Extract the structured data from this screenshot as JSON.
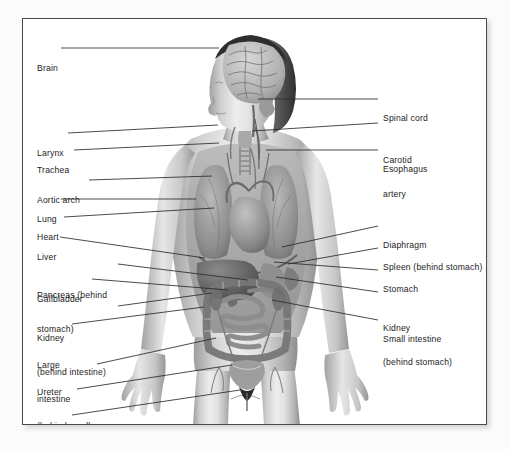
{
  "panel": {
    "border_color": "#4a4a4a",
    "background": "#ffffff"
  },
  "figure": {
    "style": "grayscale medical illustration",
    "ink": "#4b4b4b"
  },
  "labels_left": [
    {
      "text": "Brain",
      "lines": [
        "Brain"
      ]
    },
    {
      "text": "Larynx",
      "lines": [
        "Larynx"
      ]
    },
    {
      "text": "Trachea",
      "lines": [
        "Trachea"
      ]
    },
    {
      "text": "Aortic arch",
      "lines": [
        "Aortic arch"
      ]
    },
    {
      "text": "Lung",
      "lines": [
        "Lung"
      ]
    },
    {
      "text": "Heart",
      "lines": [
        "Heart"
      ]
    },
    {
      "text": "Liver",
      "lines": [
        "Liver"
      ]
    },
    {
      "text": "Pancreas (behind stomach)",
      "lines": [
        "Pancreas (behind",
        "stomach)"
      ]
    },
    {
      "text": "Gallbladder",
      "lines": [
        "Gallbladder"
      ]
    },
    {
      "text": "Kidney (behind intestine)",
      "lines": [
        "Kidney",
        "(behind intestine)"
      ]
    },
    {
      "text": "Large intestine",
      "lines": [
        "Large",
        "intestine"
      ]
    },
    {
      "text": "Ureter (behind small intestine)",
      "lines": [
        "Ureter",
        "(behind small",
        "intestine)"
      ]
    },
    {
      "text": "Urinary bladder",
      "lines": [
        "Urinary",
        "bladder"
      ]
    },
    {
      "text": "Urethra",
      "lines": [
        "Urethra"
      ]
    }
  ],
  "labels_right": [
    {
      "text": "Spinal cord",
      "lines": [
        "Spinal cord"
      ]
    },
    {
      "text": "Carotid artery",
      "lines": [
        "Carotid",
        "artery"
      ]
    },
    {
      "text": "Esophagus",
      "lines": [
        "Esophagus"
      ]
    },
    {
      "text": "Diaphragm",
      "lines": [
        "Diaphragm"
      ]
    },
    {
      "text": "Spleen (behind stomach)",
      "lines": [
        "Spleen (behind stomach)"
      ]
    },
    {
      "text": "Stomach",
      "lines": [
        "Stomach"
      ]
    },
    {
      "text": "Kidney (behind stomach)",
      "lines": [
        "Kidney",
        "(behind stomach)"
      ]
    },
    {
      "text": "Small intestine",
      "lines": [
        "Small intestine"
      ]
    }
  ]
}
